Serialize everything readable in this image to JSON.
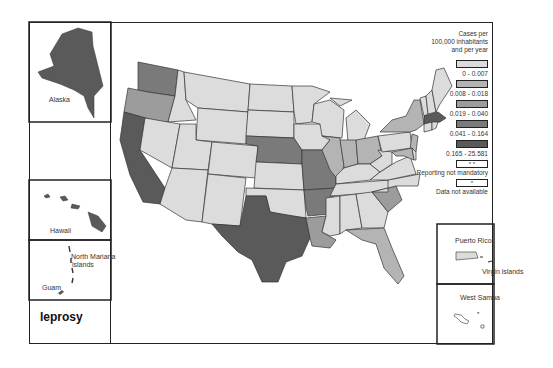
{
  "title": "leprosy",
  "legend": {
    "heading_line1": "Cases per",
    "heading_line2": "100,000 inhabitants",
    "heading_line3": "and per year",
    "classes": [
      {
        "label": "0 - 0.007",
        "color": "#dcdcdc"
      },
      {
        "label": "0.008 - 0.018",
        "color": "#b4b4b4"
      },
      {
        "label": "0.019 - 0.040",
        "color": "#9c9c9c"
      },
      {
        "label": "0.041 - 0.164",
        "color": "#7a7a7a"
      },
      {
        "label": "0.165 - 25.581",
        "color": "#5a5a5a"
      }
    ],
    "not_mandatory": {
      "symbol": "* *",
      "label": "Reporting not mandatory"
    },
    "not_available": {
      "symbol": "*",
      "label": "Data not available"
    }
  },
  "insets": {
    "alaska": "Alaska",
    "hawaii": "Hawaii",
    "north_mariana_line1": "North Mariana",
    "north_mariana_line2": "islands",
    "guam": "Guam",
    "puerto_rico": "Puerto Rico",
    "virgin_islands": "Virgin islands",
    "west_samoa": "West Samoa"
  },
  "states_by_class": {
    "0-0.007": [
      "MT",
      "ID",
      "WY",
      "NV",
      "UT",
      "CO",
      "AZ",
      "NM",
      "ND",
      "SD",
      "KS",
      "OK",
      "MN",
      "IA",
      "WI",
      "MI",
      "KY",
      "TN",
      "MS",
      "AL",
      "GA",
      "NC",
      "VA",
      "WV",
      "PA",
      "ME",
      "NH",
      "VT",
      "CT",
      "RI",
      "DE"
    ],
    "0.008-0.018": [
      "NY",
      "IL",
      "IN",
      "OH",
      "FL",
      "NJ",
      "MD"
    ],
    "0.019-0.040": [
      "OR",
      "LA",
      "SC"
    ],
    "0.041-0.164": [
      "WA",
      "NE",
      "MO",
      "AR"
    ],
    "0.165-25.581": [
      "CA",
      "TX",
      "MA",
      "AK",
      "HI"
    ]
  }
}
